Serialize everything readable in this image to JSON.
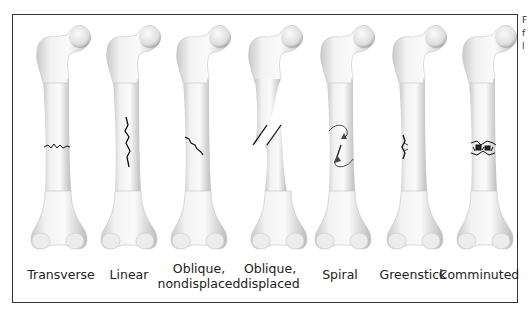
{
  "figure": {
    "cut_off_text": [
      "F",
      "f",
      "l"
    ]
  },
  "fracture_types": [
    {
      "id": "transverse",
      "label_line1": "Transverse",
      "label_line2": ""
    },
    {
      "id": "linear",
      "label_line1": "Linear",
      "label_line2": ""
    },
    {
      "id": "oblique-nondisplaced",
      "label_line1": "Oblique,",
      "label_line2": "nondisplaced"
    },
    {
      "id": "oblique-displaced",
      "label_line1": "Oblique,",
      "label_line2": "displaced"
    },
    {
      "id": "spiral",
      "label_line1": "Spiral",
      "label_line2": ""
    },
    {
      "id": "greenstick",
      "label_line1": "Greenstick",
      "label_line2": ""
    },
    {
      "id": "comminuted",
      "label_line1": "Comminuted",
      "label_line2": ""
    }
  ],
  "colors": {
    "bone_light": "#f4f4f4",
    "bone_shade": "#bdbdbd",
    "fracture_line": "#111111",
    "frame_border": "#333333"
  }
}
